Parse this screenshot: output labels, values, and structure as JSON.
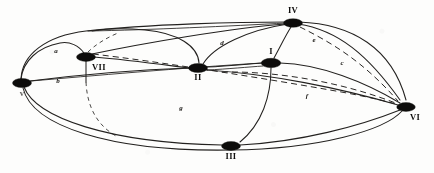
{
  "figure": {
    "type": "graph-diagram",
    "background_color": "#fdfdfc",
    "ink_color": "#14120f",
    "width": 434,
    "height": 173
  },
  "nodes": [
    {
      "id": "V",
      "label": "v",
      "x": 22,
      "y": 83,
      "rx": 9.5,
      "ry": 4.6,
      "label_x": 22,
      "label_y": 96,
      "faint": true
    },
    {
      "id": "VII",
      "label": "VII",
      "x": 86,
      "y": 57,
      "rx": 9.5,
      "ry": 4.4,
      "label_x": 99,
      "label_y": 70,
      "faint": false
    },
    {
      "id": "II",
      "label": "II",
      "x": 198,
      "y": 68,
      "rx": 9.5,
      "ry": 4.5,
      "label_x": 198,
      "label_y": 80,
      "faint": false
    },
    {
      "id": "I",
      "label": "I",
      "x": 271,
      "y": 63,
      "rx": 9.8,
      "ry": 4.7,
      "label_x": 271,
      "label_y": 54,
      "faint": false
    },
    {
      "id": "IV",
      "label": "IV",
      "x": 293,
      "y": 23,
      "rx": 9.5,
      "ry": 4.3,
      "label_x": 293,
      "label_y": 13,
      "faint": false
    },
    {
      "id": "VI",
      "label": "VI",
      "x": 406,
      "y": 107,
      "rx": 9.3,
      "ry": 4.4,
      "label_x": 415,
      "label_y": 120,
      "faint": false
    },
    {
      "id": "III",
      "label": "III",
      "x": 231,
      "y": 146,
      "rx": 9.5,
      "ry": 4.4,
      "label_x": 231,
      "label_y": 159,
      "faint": false
    }
  ],
  "edge_labels": [
    {
      "text": "a",
      "x": 56,
      "y": 53
    },
    {
      "text": "b",
      "x": 58,
      "y": 83
    },
    {
      "text": "d",
      "x": 222,
      "y": 45
    },
    {
      "text": "e",
      "x": 314,
      "y": 42
    },
    {
      "text": "c",
      "x": 342,
      "y": 65
    },
    {
      "text": "f",
      "x": 307,
      "y": 98
    },
    {
      "text": "g",
      "x": 181,
      "y": 110
    }
  ],
  "edges": [
    {
      "from": "V",
      "to": "VII",
      "style": "solid"
    },
    {
      "from": "V",
      "to": "IV",
      "style": "solid"
    },
    {
      "from": "V",
      "to": "II",
      "style": "solid"
    },
    {
      "from": "V",
      "to": "I",
      "style": "solid"
    },
    {
      "from": "V",
      "to": "III",
      "style": "solid"
    },
    {
      "from": "V",
      "to": "VI",
      "style": "solid"
    },
    {
      "from": "VII",
      "to": "IV",
      "style": "solid"
    },
    {
      "from": "VII",
      "to": "II",
      "style": "solid"
    },
    {
      "from": "VII",
      "to": "VI",
      "style": "dashed"
    },
    {
      "from": "VII",
      "to": "III",
      "style": "dashed"
    },
    {
      "from": "II",
      "to": "IV",
      "style": "solid"
    },
    {
      "from": "II",
      "to": "I",
      "style": "solid"
    },
    {
      "from": "II",
      "to": "VI",
      "style": "solid"
    },
    {
      "from": "I",
      "to": "IV",
      "style": "solid"
    },
    {
      "from": "I",
      "to": "VI",
      "style": "solid"
    },
    {
      "from": "I",
      "to": "III",
      "style": "solid"
    },
    {
      "from": "IV",
      "to": "VI",
      "style": "solid"
    },
    {
      "from": "III",
      "to": "VI",
      "style": "solid"
    }
  ]
}
